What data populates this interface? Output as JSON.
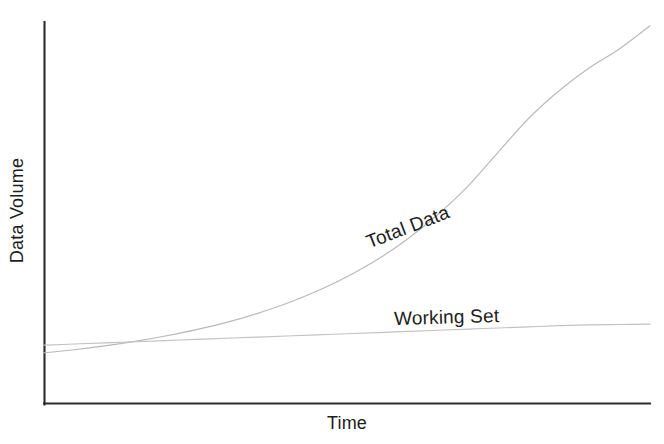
{
  "chart_data": {
    "type": "line",
    "title": "",
    "subtitle": "",
    "xlabel": "Time",
    "ylabel": "Data Volume",
    "grid": false,
    "legend_position": "inline-annotations",
    "axis_style": "L-shaped, no ticks, no tick labels",
    "xlim": [
      0,
      100
    ],
    "ylim": [
      0,
      100
    ],
    "x_tick_labels": [],
    "y_tick_labels": [],
    "x": [
      0,
      5,
      10,
      15,
      20,
      25,
      30,
      35,
      40,
      45,
      50,
      55,
      60,
      65,
      70,
      75,
      80,
      85,
      90,
      95,
      100
    ],
    "series": [
      {
        "name": "Total Data",
        "color": "#b9b9b9",
        "shape": "exponential growth",
        "values": [
          13.4,
          14.2,
          15.2,
          16.4,
          17.8,
          19.4,
          21.3,
          23.6,
          26.3,
          29.5,
          33.3,
          37.8,
          43.2,
          49.6,
          57.1,
          66.0,
          74.8,
          82.0,
          88.0,
          93.0,
          99.0
        ]
      },
      {
        "name": "Working Set",
        "color": "#c2c2c2",
        "shape": "near-linear slow growth",
        "values": [
          15.4,
          15.7,
          16.0,
          16.3,
          16.6,
          16.9,
          17.2,
          17.5,
          17.8,
          18.1,
          18.4,
          18.7,
          19.0,
          19.3,
          19.6,
          19.9,
          20.2,
          20.5,
          20.7,
          20.8,
          20.9
        ]
      }
    ],
    "annotations": [
      {
        "text": "Total Data",
        "rotation_degrees": -21,
        "attached_series": "Total Data"
      },
      {
        "text": "Working Set",
        "rotation_degrees": -1.6,
        "attached_series": "Working Set"
      }
    ]
  },
  "axes": {
    "y_axis_title": "Data Volume",
    "x_axis_title": "Time",
    "axis_color": "#2b2b2b"
  },
  "labels": {
    "total_data": "Total Data",
    "working_set": "Working Set"
  },
  "colors": {
    "background": "#ffffff",
    "axis": "#2b2b2b",
    "total_data_line": "#b9b9b9",
    "working_set_line": "#c2c2c2",
    "text": "#1d1d1d"
  }
}
